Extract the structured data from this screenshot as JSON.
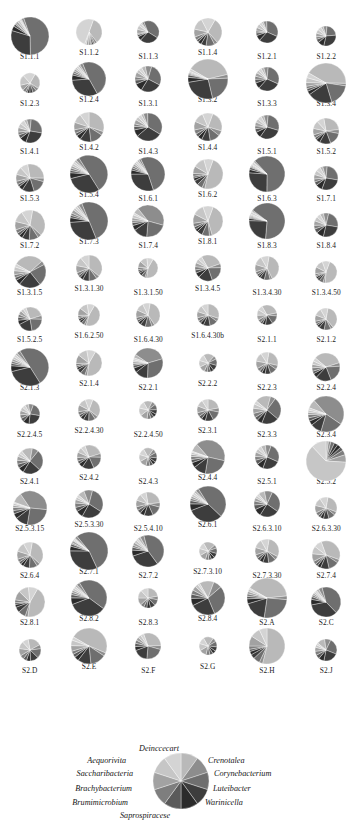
{
  "figure": {
    "type": "pie-chart-grid",
    "panel_count": 78,
    "columns": 6,
    "segment_count": 10
  },
  "chart_data": {
    "type": "pie",
    "title": "",
    "xlabel": "",
    "ylabel": "",
    "legend_position": "bottom",
    "grid": false,
    "categories": [
      "Deinccecart",
      "Crenotalea",
      "Corynebacterium",
      "Luteibacter",
      "Warinicella",
      "Saprospiracese",
      "Brumimicrobium",
      "Brachybacterium",
      "Saccharibacteria",
      "Aequorivita"
    ],
    "colors": [
      "#b9b9b9",
      "#8d8d8d",
      "#6f6f6f",
      "#3d3d3d",
      "#2b2b2b",
      "#5a5a5a",
      "#7e7e7e",
      "#a2a2a2",
      "#c6c6c6",
      "#d4d4d4"
    ],
    "legend_reference": {
      "label": "reference pie showing all ten genera at equal proportion",
      "values": [
        10,
        10,
        10,
        10,
        10,
        10,
        10,
        10,
        10,
        10
      ]
    },
    "panels": [
      {
        "label": "S1.1.1",
        "values": [
          1,
          2,
          55,
          30,
          4,
          2,
          1,
          2,
          2,
          1
        ]
      },
      {
        "label": "S1.1.2",
        "values": [
          34,
          3,
          2,
          2,
          1,
          1,
          2,
          3,
          2,
          50
        ]
      },
      {
        "label": "S1.1.3",
        "values": [
          2,
          3,
          40,
          28,
          6,
          3,
          2,
          6,
          6,
          4
        ]
      },
      {
        "label": "S1.1.4",
        "values": [
          30,
          4,
          10,
          6,
          4,
          3,
          4,
          9,
          14,
          16
        ]
      },
      {
        "label": "S1.2.1",
        "values": [
          3,
          5,
          32,
          30,
          8,
          4,
          3,
          5,
          6,
          4
        ]
      },
      {
        "label": "S1.2.2",
        "values": [
          4,
          6,
          22,
          30,
          10,
          6,
          4,
          6,
          6,
          6
        ]
      },
      {
        "label": "S1.2.3",
        "values": [
          26,
          5,
          6,
          5,
          4,
          3,
          5,
          9,
          17,
          20
        ]
      },
      {
        "label": "S1.2.4",
        "values": [
          2,
          3,
          48,
          32,
          5,
          2,
          2,
          2,
          2,
          2
        ]
      },
      {
        "label": "S1.3.1",
        "values": [
          5,
          8,
          28,
          26,
          10,
          5,
          4,
          6,
          4,
          4
        ]
      },
      {
        "label": "S1.3.2",
        "values": [
          38,
          3,
          22,
          26,
          4,
          2,
          1,
          1,
          1,
          2
        ]
      },
      {
        "label": "S1.3.3",
        "values": [
          4,
          6,
          30,
          30,
          8,
          5,
          4,
          5,
          4,
          4
        ]
      },
      {
        "label": "S1.3.4",
        "values": [
          42,
          2,
          18,
          20,
          3,
          2,
          2,
          3,
          4,
          4
        ]
      },
      {
        "label": "S1.4.1",
        "values": [
          4,
          6,
          26,
          28,
          9,
          5,
          4,
          6,
          6,
          6
        ]
      },
      {
        "label": "S1.4.2",
        "values": [
          30,
          4,
          14,
          12,
          5,
          3,
          4,
          8,
          10,
          10
        ]
      },
      {
        "label": "S1.4.3",
        "values": [
          3,
          5,
          34,
          30,
          8,
          4,
          3,
          5,
          4,
          4
        ]
      },
      {
        "label": "S1.4.4",
        "values": [
          24,
          6,
          12,
          10,
          5,
          4,
          5,
          10,
          12,
          12
        ]
      },
      {
        "label": "S1.5.1",
        "values": [
          4,
          6,
          28,
          30,
          8,
          5,
          4,
          5,
          5,
          5
        ]
      },
      {
        "label": "S1.5.2",
        "values": [
          26,
          5,
          16,
          14,
          5,
          3,
          4,
          8,
          10,
          9
        ]
      },
      {
        "label": "S1.5.3",
        "values": [
          28,
          4,
          16,
          14,
          5,
          3,
          4,
          8,
          9,
          9
        ]
      },
      {
        "label": "S1.5.4",
        "values": [
          2,
          3,
          50,
          30,
          5,
          2,
          2,
          2,
          2,
          2
        ]
      },
      {
        "label": "S1.6.1",
        "values": [
          2,
          2,
          52,
          30,
          4,
          2,
          2,
          2,
          2,
          2
        ]
      },
      {
        "label": "S1.6.2",
        "values": [
          48,
          3,
          6,
          5,
          3,
          2,
          3,
          8,
          12,
          10
        ]
      },
      {
        "label": "S1.6.3",
        "values": [
          1,
          1,
          62,
          26,
          3,
          2,
          1,
          1,
          1,
          2
        ]
      },
      {
        "label": "S1.7.1",
        "values": [
          4,
          6,
          26,
          28,
          9,
          5,
          4,
          6,
          6,
          6
        ]
      },
      {
        "label": "S1.7.2",
        "values": [
          34,
          4,
          10,
          8,
          4,
          3,
          4,
          9,
          12,
          12
        ]
      },
      {
        "label": "S1.7.3",
        "values": [
          2,
          3,
          50,
          30,
          4,
          2,
          2,
          3,
          2,
          2
        ]
      },
      {
        "label": "S1.7.4",
        "values": [
          6,
          40,
          22,
          14,
          5,
          3,
          2,
          3,
          3,
          2
        ]
      },
      {
        "label": "S1.8.1",
        "values": [
          40,
          3,
          8,
          6,
          3,
          3,
          4,
          10,
          12,
          11
        ]
      },
      {
        "label": "S1.8.3",
        "values": [
          1,
          1,
          66,
          24,
          2,
          1,
          1,
          1,
          1,
          2
        ]
      },
      {
        "label": "S1.8.4",
        "values": [
          5,
          7,
          24,
          26,
          10,
          6,
          5,
          6,
          6,
          5
        ]
      },
      {
        "label": "S1.3.1.5",
        "values": [
          30,
          4,
          22,
          22,
          5,
          3,
          3,
          4,
          4,
          3
        ]
      },
      {
        "label": "S1.3.1.30",
        "values": [
          36,
          4,
          10,
          8,
          4,
          3,
          4,
          9,
          11,
          11
        ]
      },
      {
        "label": "S1.3.1.50",
        "values": [
          44,
          3,
          6,
          5,
          3,
          3,
          4,
          10,
          12,
          10
        ]
      },
      {
        "label": "S1.3.4.5",
        "values": [
          28,
          5,
          20,
          18,
          6,
          4,
          4,
          5,
          5,
          5
        ]
      },
      {
        "label": "S1.3.4.30",
        "values": [
          40,
          3,
          8,
          6,
          3,
          3,
          4,
          10,
          12,
          11
        ]
      },
      {
        "label": "S1.3.4.50",
        "values": [
          46,
          3,
          6,
          4,
          3,
          2,
          3,
          10,
          12,
          11
        ]
      },
      {
        "label": "S1.5.2.5",
        "values": [
          26,
          5,
          22,
          20,
          6,
          4,
          4,
          5,
          4,
          4
        ]
      },
      {
        "label": "S1.6.2.50",
        "values": [
          46,
          3,
          5,
          4,
          3,
          2,
          3,
          11,
          12,
          11
        ]
      },
      {
        "label": "S1.6.4.30",
        "values": [
          38,
          4,
          9,
          7,
          4,
          3,
          4,
          10,
          11,
          10
        ]
      },
      {
        "label": "S1.6.4.30b",
        "values": [
          30,
          5,
          12,
          10,
          5,
          4,
          5,
          9,
          10,
          10
        ]
      },
      {
        "label": "S2.1.1",
        "values": [
          30,
          5,
          14,
          12,
          5,
          4,
          5,
          8,
          9,
          8
        ]
      },
      {
        "label": "S2.1.2",
        "values": [
          36,
          4,
          10,
          8,
          4,
          3,
          4,
          9,
          11,
          11
        ]
      },
      {
        "label": "S2.1.3",
        "values": [
          2,
          3,
          50,
          30,
          5,
          2,
          2,
          2,
          2,
          2
        ]
      },
      {
        "label": "S2.1.4",
        "values": [
          44,
          3,
          6,
          5,
          3,
          2,
          3,
          11,
          12,
          11
        ]
      },
      {
        "label": "S2.2.1",
        "values": [
          4,
          36,
          30,
          14,
          5,
          3,
          2,
          2,
          2,
          2
        ]
      },
      {
        "label": "S2.2.2",
        "values": [
          20,
          6,
          12,
          10,
          6,
          5,
          6,
          11,
          12,
          12
        ]
      },
      {
        "label": "S2.2.3",
        "values": [
          26,
          6,
          10,
          8,
          5,
          4,
          5,
          11,
          13,
          12
        ]
      },
      {
        "label": "S2.2.4",
        "values": [
          34,
          4,
          20,
          18,
          5,
          3,
          4,
          4,
          4,
          4
        ]
      },
      {
        "label": "S2.2.4.5",
        "values": [
          6,
          8,
          22,
          24,
          10,
          6,
          6,
          7,
          6,
          5
        ]
      },
      {
        "label": "S2.2.4.30",
        "values": [
          30,
          5,
          10,
          8,
          5,
          4,
          5,
          10,
          12,
          11
        ]
      },
      {
        "label": "S2.2.4.50",
        "values": [
          16,
          7,
          10,
          8,
          6,
          6,
          7,
          13,
          14,
          13
        ]
      },
      {
        "label": "S2.3.1",
        "values": [
          22,
          6,
          14,
          12,
          6,
          5,
          6,
          10,
          10,
          9
        ]
      },
      {
        "label": "S2.3.3",
        "values": [
          18,
          6,
          26,
          20,
          6,
          4,
          5,
          6,
          5,
          4
        ]
      },
      {
        "label": "S2.3.4",
        "values": [
          8,
          46,
          20,
          10,
          4,
          3,
          3,
          2,
          2,
          2
        ]
      },
      {
        "label": "S2.4.1",
        "values": [
          14,
          8,
          26,
          22,
          7,
          5,
          5,
          5,
          4,
          4
        ]
      },
      {
        "label": "S2.4.2",
        "values": [
          26,
          5,
          18,
          16,
          6,
          4,
          5,
          7,
          7,
          6
        ]
      },
      {
        "label": "S2.4.3",
        "values": [
          18,
          7,
          10,
          8,
          6,
          6,
          7,
          13,
          13,
          12
        ]
      },
      {
        "label": "S2.4.4",
        "values": [
          8,
          40,
          24,
          12,
          5,
          3,
          3,
          2,
          2,
          1
        ]
      },
      {
        "label": "S2.5.1",
        "values": [
          6,
          8,
          26,
          24,
          9,
          6,
          5,
          6,
          5,
          5
        ]
      },
      {
        "label": "S2.5.2",
        "values": [
          2,
          2,
          3,
          3,
          3,
          3,
          4,
          6,
          62,
          12
        ]
      },
      {
        "label": "S2.5.3.15",
        "values": [
          10,
          36,
          26,
          12,
          5,
          3,
          3,
          2,
          2,
          1
        ]
      },
      {
        "label": "S2.5.3.30",
        "values": [
          8,
          10,
          30,
          24,
          8,
          5,
          5,
          4,
          3,
          3
        ]
      },
      {
        "label": "S2.5.4.10",
        "values": [
          26,
          6,
          14,
          12,
          6,
          5,
          5,
          9,
          9,
          8
        ]
      },
      {
        "label": "S2.6.1",
        "values": [
          2,
          3,
          46,
          32,
          6,
          3,
          2,
          2,
          2,
          2
        ]
      },
      {
        "label": "S2.6.3.10",
        "values": [
          8,
          10,
          28,
          24,
          9,
          6,
          5,
          4,
          3,
          3
        ]
      },
      {
        "label": "S2.6.3.30",
        "values": [
          28,
          5,
          10,
          8,
          5,
          4,
          5,
          11,
          12,
          12
        ]
      },
      {
        "label": "S2.6.4",
        "values": [
          34,
          4,
          10,
          8,
          4,
          3,
          4,
          10,
          12,
          11
        ]
      },
      {
        "label": "S2.7.1",
        "values": [
          1,
          2,
          54,
          32,
          4,
          2,
          1,
          2,
          1,
          1
        ]
      },
      {
        "label": "S2.7.2",
        "values": [
          3,
          4,
          44,
          30,
          6,
          3,
          2,
          3,
          3,
          2
        ]
      },
      {
        "label": "S2.7.3.10",
        "values": [
          22,
          6,
          10,
          8,
          6,
          5,
          6,
          12,
          13,
          12
        ]
      },
      {
        "label": "S2.7.3.30",
        "values": [
          30,
          5,
          10,
          8,
          5,
          4,
          5,
          10,
          12,
          11
        ]
      },
      {
        "label": "S2.7.4",
        "values": [
          36,
          4,
          12,
          10,
          4,
          3,
          4,
          9,
          9,
          9
        ]
      },
      {
        "label": "S2.8.1",
        "values": [
          44,
          3,
          8,
          6,
          3,
          2,
          3,
          10,
          11,
          10
        ]
      },
      {
        "label": "S2.8.2",
        "values": [
          2,
          3,
          44,
          34,
          6,
          3,
          2,
          2,
          2,
          2
        ]
      },
      {
        "label": "S2.8.3",
        "values": [
          22,
          6,
          10,
          8,
          6,
          5,
          6,
          12,
          13,
          12
        ]
      },
      {
        "label": "S2.8.4",
        "values": [
          14,
          8,
          30,
          24,
          7,
          4,
          4,
          4,
          3,
          2
        ]
      },
      {
        "label": "S2.A",
        "values": [
          40,
          3,
          26,
          18,
          4,
          2,
          2,
          2,
          2,
          1
        ]
      },
      {
        "label": "S2.C",
        "values": [
          3,
          4,
          42,
          34,
          6,
          3,
          2,
          2,
          2,
          2
        ]
      },
      {
        "label": "S2.D",
        "values": [
          20,
          6,
          14,
          12,
          6,
          5,
          6,
          11,
          11,
          9
        ]
      },
      {
        "label": "S2.E",
        "values": [
          48,
          3,
          14,
          12,
          4,
          3,
          3,
          5,
          5,
          3
        ]
      },
      {
        "label": "S2.F",
        "values": [
          30,
          5,
          22,
          18,
          5,
          4,
          4,
          4,
          4,
          4
        ]
      },
      {
        "label": "S2.G",
        "values": [
          18,
          7,
          10,
          8,
          6,
          6,
          7,
          13,
          13,
          12
        ]
      },
      {
        "label": "S2.H",
        "values": [
          54,
          3,
          6,
          4,
          3,
          2,
          3,
          9,
          9,
          7
        ]
      },
      {
        "label": "S2.J",
        "values": [
          12,
          9,
          24,
          22,
          8,
          6,
          6,
          6,
          4,
          3
        ]
      }
    ]
  },
  "legend": {
    "labels_right": [
      "Crenotalea",
      "Corynebacterium",
      "Luteibacter",
      "Warinicella"
    ],
    "labels_top": "Deinccecart",
    "labels_left": [
      "Aequorivita",
      "Saccharibacteria",
      "Brachybacterium",
      "Brumimicrobium"
    ],
    "labels_bottom": "Saprospiracese"
  }
}
